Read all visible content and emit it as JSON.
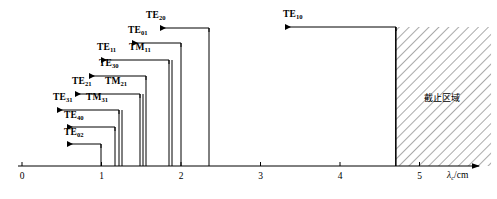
{
  "figure": {
    "kind": "waveguide-cutoff-wavelength-distribution",
    "axis": {
      "title": "λ",
      "title_sub": "c",
      "title_unit": "/cm",
      "tick_labels": [
        "0",
        "1",
        "2",
        "3",
        "4",
        "5"
      ],
      "tick_values": [
        0,
        1,
        2,
        3,
        4,
        5
      ],
      "xlim": [
        0,
        5.9
      ],
      "axis_y_px": 166,
      "x0_px": 22,
      "px_per_unit": 79.5
    },
    "cutoff_region": {
      "label": "截止区域",
      "start_value": 4.7,
      "end_value": 5.9,
      "hatch_color": "#555555"
    },
    "modes": [
      {
        "name": "TE",
        "sub": "02",
        "cutoff": 1.0
      },
      {
        "name": "TE",
        "sub": "40",
        "cutoff": 1.175
      },
      {
        "name": "TE",
        "sub": "31",
        "cutoff": 1.22
      },
      {
        "name": "TM",
        "sub": "31",
        "cutoff": 1.22
      },
      {
        "name": "TE",
        "sub": "21",
        "cutoff": 1.49
      },
      {
        "name": "TM",
        "sub": "21",
        "cutoff": 1.49
      },
      {
        "name": "TE",
        "sub": "30",
        "cutoff": 1.565
      },
      {
        "name": "TE",
        "sub": "11",
        "cutoff": 1.85
      },
      {
        "name": "TM",
        "sub": "11",
        "cutoff": 1.85
      },
      {
        "name": "TE",
        "sub": "01",
        "cutoff": 2.0
      },
      {
        "name": "TE",
        "sub": "20",
        "cutoff": 2.35
      },
      {
        "name": "TE",
        "sub": "10",
        "cutoff": 4.7
      }
    ],
    "callouts": [
      {
        "id": "te10",
        "label_name": "TE",
        "label_sub": "10",
        "label_x": 283,
        "label_y": 10,
        "arrow_tip_x": 285,
        "line_y": 27,
        "stem_x": 396
      },
      {
        "id": "te20",
        "label_name": "TE",
        "label_sub": "20",
        "label_x": 146,
        "label_y": 11,
        "arrow_tip_x": 160,
        "line_y": 28,
        "stem_x": 209
      },
      {
        "id": "te01",
        "label_name": "TE",
        "label_sub": "01",
        "label_x": 128,
        "label_y": 26,
        "arrow_tip_x": 132,
        "line_y": 43,
        "stem_x": 181
      },
      {
        "id": "te11",
        "label_name": "TE",
        "label_sub": "11",
        "label_x": 97,
        "label_y": 43,
        "arrow_tip_x": 101,
        "line_y": 60,
        "stem_x": 169
      },
      {
        "id": "tm11",
        "label_name": "TM",
        "label_sub": "11",
        "label_x": 129,
        "label_y": 43
      },
      {
        "id": "te30",
        "label_name": "TE",
        "label_sub": "30",
        "label_x": 99,
        "label_y": 59,
        "arrow_tip_x": 89,
        "line_y": 76,
        "stem_x": 146
      },
      {
        "id": "te21",
        "label_name": "TE",
        "label_sub": "21",
        "label_x": 72,
        "label_y": 77,
        "arrow_tip_x": 75,
        "line_y": 94,
        "stem_x": 140
      },
      {
        "id": "tm21",
        "label_name": "TM",
        "label_sub": "21",
        "label_x": 105,
        "label_y": 77
      },
      {
        "id": "te31",
        "label_name": "TE",
        "label_sub": "31",
        "label_x": 53,
        "label_y": 93,
        "arrow_tip_x": 57,
        "line_y": 110,
        "stem_x": 119
      },
      {
        "id": "tm31",
        "label_name": "TM",
        "label_sub": "31",
        "label_x": 86,
        "label_y": 93
      },
      {
        "id": "te40",
        "label_name": "TE",
        "label_sub": "40",
        "label_x": 64,
        "label_y": 111,
        "arrow_tip_x": 67,
        "line_y": 127,
        "stem_x": 115
      },
      {
        "id": "te02",
        "label_name": "TE",
        "label_sub": "02",
        "label_x": 64,
        "label_y": 128,
        "arrow_tip_x": 67,
        "line_y": 144,
        "stem_x": 101
      }
    ],
    "verticals": [
      {
        "x": 101,
        "top": 144
      },
      {
        "x": 115,
        "top": 127
      },
      {
        "x": 119,
        "top": 110
      },
      {
        "x": 122,
        "top": 110
      },
      {
        "x": 140,
        "top": 94
      },
      {
        "x": 143,
        "top": 94
      },
      {
        "x": 146,
        "top": 76
      },
      {
        "x": 169,
        "top": 60
      },
      {
        "x": 172,
        "top": 60
      },
      {
        "x": 181,
        "top": 43
      },
      {
        "x": 209,
        "top": 28
      },
      {
        "x": 396,
        "top": 27
      }
    ]
  }
}
